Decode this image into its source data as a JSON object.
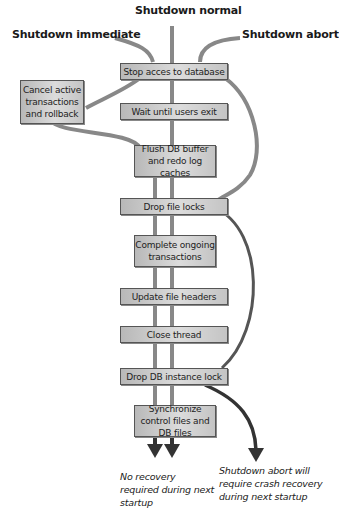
{
  "diagram": {
    "modes": {
      "normal": "Shutdown normal",
      "immediate": "Shutdown immediate",
      "abort": "Shutdown abort"
    },
    "steps": [
      {
        "id": "stop-access",
        "label": "Stop acces to database"
      },
      {
        "id": "wait-users",
        "label": "Wait until users exit"
      },
      {
        "id": "flush",
        "label": "Flush DB buffer and redo log caches"
      },
      {
        "id": "drop-file-locks",
        "label": "Drop file locks"
      },
      {
        "id": "complete-tx",
        "label": "Complete ongoing transactions"
      },
      {
        "id": "update-headers",
        "label": "Update file headers"
      },
      {
        "id": "close-thread",
        "label": "Close thread"
      },
      {
        "id": "drop-instance-lock",
        "label": "Drop DB instance lock"
      },
      {
        "id": "sync",
        "label": "Synchronize control files and DB files"
      }
    ],
    "side_step": {
      "id": "cancel-tx",
      "label": "Cancel active transactions and rollback"
    },
    "outcomes": {
      "no_recovery": "No recovery required during next startup",
      "abort_recovery": "Shutdown abort will require crash recovery during next startup"
    },
    "colors": {
      "line_light": "#888888",
      "line_dark": "#333333",
      "box_fill": "#d0d0d0",
      "box_border": "#555555"
    }
  }
}
